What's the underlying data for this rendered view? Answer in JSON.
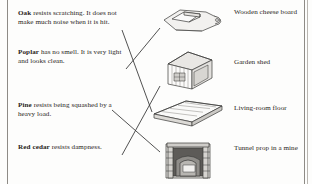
{
  "page": {
    "ink_color": "#2a2522",
    "rule_color": "#8e8b86",
    "background": "#fdfdfc"
  },
  "descriptions": [
    {
      "id": "oak",
      "wood": "Oak",
      "text": " resists scratching. It does not make much noise when it is hit."
    },
    {
      "id": "poplar",
      "wood": "Poplar",
      "text": " has no smell. It is very light and looks clean."
    },
    {
      "id": "pine",
      "wood": "Pine",
      "text": " resists being squashed by a heavy load."
    },
    {
      "id": "red-cedar",
      "wood": "Red cedar",
      "text": " resists dampness."
    }
  ],
  "objects": [
    {
      "id": "cheese-board",
      "label": "Wooden cheese board",
      "icon": "cheese-board-icon"
    },
    {
      "id": "garden-shed",
      "label": "Garden shed",
      "icon": "garden-shed-icon"
    },
    {
      "id": "living-room-floor",
      "label": "Living-room floor",
      "icon": "floorboards-icon"
    },
    {
      "id": "tunnel-prop",
      "label": "Tunnel prop in a mine",
      "icon": "mine-tunnel-icon"
    }
  ],
  "connections": [
    {
      "from": "oak",
      "to": "living-room-floor"
    },
    {
      "from": "poplar",
      "to": "cheese-board"
    },
    {
      "from": "pine",
      "to": "tunnel-prop"
    },
    {
      "from": "red-cedar",
      "to": "garden-shed"
    }
  ]
}
